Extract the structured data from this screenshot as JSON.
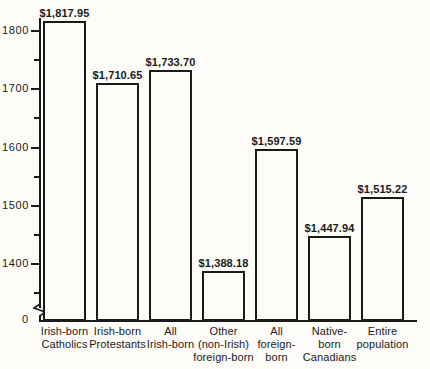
{
  "chart_data": {
    "type": "bar",
    "title": "",
    "xlabel": "",
    "ylabel": "",
    "ylim": [
      1350,
      1850
    ],
    "grid": false,
    "legend": "none",
    "axis_break": true,
    "categories": [
      "Irish-born\nCatholics",
      "Irish-born\nProtestants",
      "All\nIrish-born",
      "Other\n(non-Irish)\nforeign-born",
      "All\nforeign-\nborn",
      "Native-\nborn\nCanadians",
      "Entire\npopulation"
    ],
    "values": [
      1817.95,
      1710.65,
      1733.7,
      1388.18,
      1597.59,
      1447.94,
      1515.22
    ],
    "value_labels": [
      "$1,817.95",
      "$1,710.65",
      "$1,733.70",
      "$1,388.18",
      "$1,597.59",
      "$1,447.94",
      "$1,515.22"
    ],
    "y_major_ticks": [
      1400,
      1500,
      1600,
      1700,
      1800
    ],
    "y_major_tick_labels": [
      "1400",
      "1500",
      "1600",
      "1700",
      "1800"
    ],
    "y_minor_ticks": [
      1350,
      1450,
      1550,
      1650,
      1750
    ],
    "zero_label": "0",
    "colors": {
      "bar_fill": "#fdfcf8",
      "bar_stroke": "#1a1a1a",
      "axis": "#1a1a1a",
      "background": "#fdfcf8",
      "text": "#1a1a1a"
    }
  }
}
